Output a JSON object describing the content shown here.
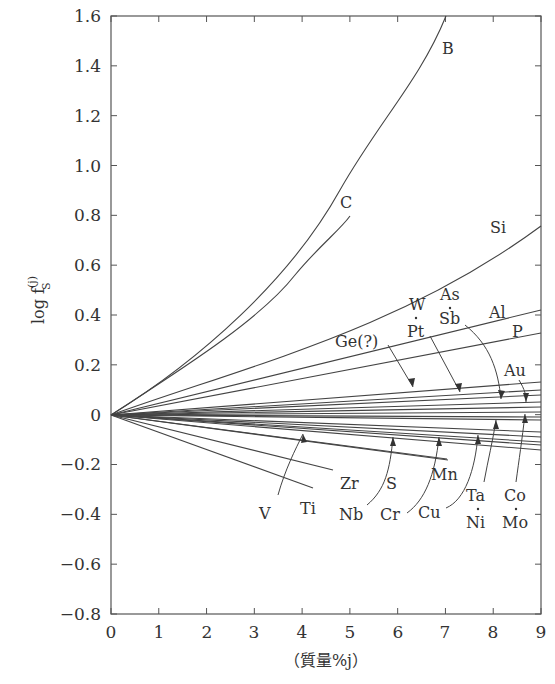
{
  "chart_data": {
    "type": "line",
    "title": "",
    "xlabel": "（質量%j）",
    "ylabel": "log f_S^(j)",
    "xlim": [
      0,
      9
    ],
    "ylim": [
      -0.8,
      1.6
    ],
    "grid": false,
    "legend": "none (curves labeled directly)",
    "x_ticks": [
      "0",
      "1",
      "2",
      "3",
      "4",
      "5",
      "6",
      "7",
      "8",
      "9"
    ],
    "y_ticks": [
      "1.6",
      "1.4",
      "1.2",
      "1.0",
      "0.8",
      "0.6",
      "0.4",
      "0.2",
      "0",
      "−0.2",
      "−0.4",
      "−0.6",
      "−0.8"
    ],
    "series": [
      {
        "name": "B",
        "x": [
          0,
          1,
          2,
          3,
          4,
          5,
          6,
          6.9
        ],
        "values": [
          0,
          0.14,
          0.31,
          0.52,
          0.75,
          1.02,
          1.3,
          1.6
        ]
      },
      {
        "name": "C",
        "x": [
          0,
          1,
          2,
          3,
          4,
          5
        ],
        "values": [
          0,
          0.13,
          0.28,
          0.44,
          0.61,
          0.8
        ]
      },
      {
        "name": "Si",
        "x": [
          0,
          3,
          6,
          9
        ],
        "values": [
          0,
          0.22,
          0.46,
          0.76
        ]
      },
      {
        "name": "Al",
        "x": [
          0,
          9
        ],
        "values": [
          0,
          0.42
        ]
      },
      {
        "name": "P",
        "x": [
          0,
          9
        ],
        "values": [
          0,
          0.33
        ]
      },
      {
        "name": "Au",
        "x": [
          0,
          9
        ],
        "values": [
          0,
          0.13
        ]
      },
      {
        "name": "Ge(?)",
        "x": [
          0,
          9
        ],
        "values": [
          0,
          0.1
        ]
      },
      {
        "name": "W",
        "x": [
          0,
          9
        ],
        "values": [
          0,
          0.08
        ]
      },
      {
        "name": "Pt",
        "x": [
          0,
          9
        ],
        "values": [
          0,
          0.08
        ]
      },
      {
        "name": "As",
        "x": [
          0,
          9
        ],
        "values": [
          0,
          0.05
        ]
      },
      {
        "name": "Sb",
        "x": [
          0,
          9
        ],
        "values": [
          0,
          0.05
        ]
      },
      {
        "name": "Co",
        "x": [
          0,
          9
        ],
        "values": [
          0,
          0.03
        ]
      },
      {
        "name": "Mo",
        "x": [
          0,
          9
        ],
        "values": [
          0,
          0.03
        ]
      },
      {
        "name": "Ta",
        "x": [
          0,
          9
        ],
        "values": [
          0,
          0.01
        ]
      },
      {
        "name": "Ni",
        "x": [
          0,
          9
        ],
        "values": [
          0,
          0.01
        ]
      },
      {
        "name": "Cu",
        "x": [
          0,
          9
        ],
        "values": [
          0,
          -0.07
        ]
      },
      {
        "name": "Cr",
        "x": [
          0,
          9
        ],
        "values": [
          0,
          -0.09
        ]
      },
      {
        "name": "Mn",
        "x": [
          0,
          9
        ],
        "values": [
          0,
          -0.11
        ]
      },
      {
        "name": "Nb",
        "x": [
          0,
          9
        ],
        "values": [
          0,
          -0.12
        ]
      },
      {
        "name": "V",
        "x": [
          0,
          9
        ],
        "values": [
          0,
          -0.14
        ]
      },
      {
        "name": "S",
        "x": [
          0,
          6
        ],
        "values": [
          0,
          -0.18
        ]
      },
      {
        "name": "Zr",
        "x": [
          0,
          5
        ],
        "values": [
          0,
          -0.22
        ]
      },
      {
        "name": "Ti",
        "x": [
          0,
          4.3
        ],
        "values": [
          0,
          -0.3
        ]
      }
    ]
  },
  "labels": {
    "B": "B",
    "C": "C",
    "Si": "Si",
    "Al": "Al",
    "P": "P",
    "Au": "Au",
    "Ge": "Ge(?)",
    "W": "W",
    "Pt": "Pt",
    "As": "As",
    "Sb": "Sb",
    "V": "V",
    "Ti": "Ti",
    "Zr": "Zr",
    "Nb": "Nb",
    "S": "S",
    "Cr": "Cr",
    "Mn": "Mn",
    "Cu": "Cu",
    "Ta": "Ta",
    "Ni": "Ni",
    "Co": "Co",
    "Mo": "Mo"
  },
  "axes": {
    "xlabel": "（質量%j）",
    "ylabel_main": "log f",
    "ylabel_sup": "(j)",
    "ylabel_sub": "S"
  }
}
